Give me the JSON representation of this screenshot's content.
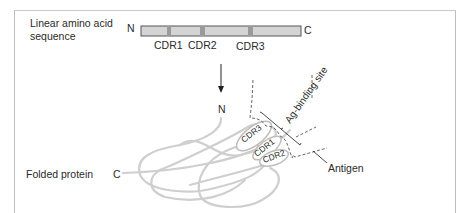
{
  "diagram": {
    "linear_label_line1": "Linear amino acid",
    "linear_label_line2": "sequence",
    "n_terminus_top": "N",
    "c_terminus_top": "C",
    "cdr_labels": [
      "CDR1",
      "CDR2",
      "CDR3"
    ],
    "n_terminus_folded": "N",
    "folded_label": "Folded protein",
    "c_terminus_folded": "C",
    "binding_site_label": "Ag-binding site",
    "antigen_label": "Antigen",
    "loop_labels": [
      "CDR3",
      "CDR1",
      "CDR2"
    ],
    "colors": {
      "bar_fill": "#d4d4d4",
      "bar_stroke": "#555555",
      "cdr_band": "#9a9a9a",
      "chain": "#cfcfcf",
      "text": "#2a2a2a"
    }
  }
}
